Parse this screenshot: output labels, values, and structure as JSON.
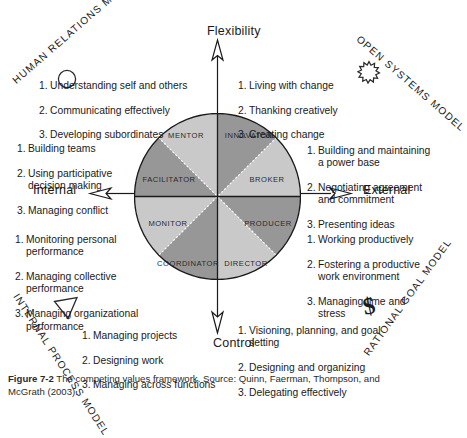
{
  "figure": {
    "axes": {
      "top": "Flexibility",
      "bottom": "Control",
      "left": "Internal",
      "right": "External"
    },
    "models": {
      "top_left": "HUMAN RELATIONS MODEL",
      "top_right": "OPEN SYSTEMS MODEL",
      "bottom_left": "INTERNAL PROCESS MODEL",
      "bottom_right": "RATIONAL GOAL MODEL"
    },
    "icons": {
      "top_left": "circle-icon",
      "top_right": "star-burst-icon",
      "bottom_left": "triangle-icon",
      "bottom_right": "dollar-sign-icon"
    },
    "wheel": {
      "segments": [
        {
          "label": "MENTOR",
          "shade": "light"
        },
        {
          "label": "INNOVATOR",
          "shade": "dark"
        },
        {
          "label": "BROKER",
          "shade": "light"
        },
        {
          "label": "PRODUCER",
          "shade": "dark"
        },
        {
          "label": "DIRECTOR",
          "shade": "light"
        },
        {
          "label": "COORDINATOR",
          "shade": "dark"
        },
        {
          "label": "MONITOR",
          "shade": "light"
        },
        {
          "label": "FACILITATOR",
          "shade": "dark"
        }
      ],
      "colors": {
        "light": "#c9c9c9",
        "dark": "#979797",
        "outline": "#1a1a1a",
        "label_text": "#2a2a2a"
      }
    },
    "competency_lists": {
      "mentor": [
        "Understanding self and others",
        "Communicating effectively",
        "Developing subordinates"
      ],
      "facilitator": [
        "Building teams",
        "Using participative decision making",
        "Managing conflict"
      ],
      "innovator": [
        "Living with change",
        "Thanking creatively",
        "Creating change"
      ],
      "broker": [
        "Building and maintaining a power base",
        "Negotiating agreement and commitment",
        "Presenting ideas"
      ],
      "monitor": [
        "Monitoring personal performance",
        "Managing collective performance",
        "Managing organizational performance"
      ],
      "coordinator": [
        "Managing projects",
        "Designing work",
        "Managing across functions"
      ],
      "producer": [
        "Working productively",
        "Fostering a productive work environment",
        "Managing time and stress"
      ],
      "director": [
        "Visioning, planning, and goal setting",
        "Designing and organizing",
        "Delegating effectively"
      ]
    },
    "caption": {
      "label": "Figure 7-2",
      "text": "The competing values framework. Source: Quinn, Faerman, Thompson, and",
      "tail": "McGrath (2003)."
    }
  }
}
